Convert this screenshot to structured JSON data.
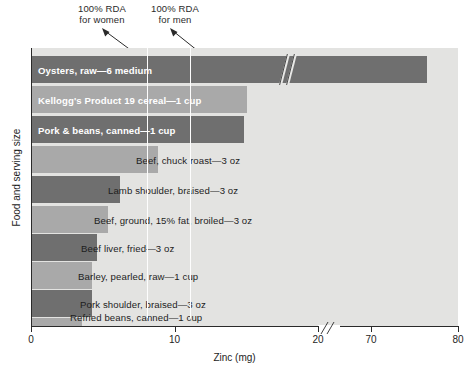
{
  "chart_data": {
    "type": "bar",
    "orientation": "horizontal",
    "title": "",
    "xlabel": "Zinc (mg)",
    "ylabel": "Food and serving size",
    "xlim": [
      0,
      80
    ],
    "xticks": [
      "0",
      "10",
      "20",
      "70",
      "80"
    ],
    "xtick_values": [
      0,
      10,
      20,
      70,
      80
    ],
    "axis_break": true,
    "axis_break_between": [
      20,
      70
    ],
    "grid": false,
    "legend": "none",
    "categories": [
      "Oysters, raw—6 medium",
      "Kellogg's Product 19 cereal—1 cup",
      "Pork & beans, canned—1 cup",
      "Beef, chuck roast—3 oz",
      "Lamb shoulder, braised—3 oz",
      "Beef, ground, 15% fat, broiled—3 oz",
      "Beef liver, fried—3 oz",
      "Barley, pearled, raw—1 cup",
      "Pork shoulder, braised—3 oz",
      "Refried beans, canned—1 cup"
    ],
    "values": [
      76.3,
      15.0,
      14.8,
      8.8,
      6.1,
      5.3,
      4.5,
      4.2,
      4.2,
      3.5
    ],
    "annotations": [
      {
        "label": "100% RDA\nfor women",
        "value": 8
      },
      {
        "label": "100% RDA\nfor men",
        "value": 11
      }
    ]
  },
  "axis": {
    "x_title": "Zinc (mg)",
    "y_title": "Food and serving size",
    "tick_0": "0",
    "tick_10": "10",
    "tick_20": "20",
    "tick_70": "70",
    "tick_80": "80"
  },
  "annotations": {
    "women": "100% RDA\nfor women",
    "men": "100% RDA\nfor men"
  },
  "bars": [
    {
      "label": "Oysters, raw—6 medium",
      "value": 76.3,
      "style": "dark",
      "label_position": "inside"
    },
    {
      "label": "Kellogg's Product 19 cereal—1 cup",
      "value": 15.0,
      "style": "light",
      "label_position": "inside"
    },
    {
      "label": "Pork & beans, canned—1 cup",
      "value": 14.8,
      "style": "dark",
      "label_position": "inside"
    },
    {
      "label": "Beef, chuck roast—3 oz",
      "value": 8.8,
      "style": "light",
      "label_position": "outside"
    },
    {
      "label": "Lamb shoulder, braised—3 oz",
      "value": 6.1,
      "style": "dark",
      "label_position": "outside"
    },
    {
      "label": "Beef, ground, 15% fat, broiled—3 oz",
      "value": 5.3,
      "style": "light",
      "label_position": "outside"
    },
    {
      "label": "Beef liver, fried—3 oz",
      "value": 4.5,
      "style": "dark",
      "label_position": "outside"
    },
    {
      "label": "Barley, pearled, raw—1 cup",
      "value": 4.2,
      "style": "light",
      "label_position": "outside"
    },
    {
      "label": "Pork shoulder, braised—3 oz",
      "value": 4.2,
      "style": "dark",
      "label_position": "outside"
    },
    {
      "label": "Refried beans, canned—1 cup",
      "value": 3.5,
      "style": "light",
      "label_position": "outside"
    }
  ],
  "colors": {
    "plot_background": "#e3e3e1",
    "bar_dark": "#6f6f6f",
    "bar_light": "#a9a9a9",
    "axis": "#2a2a2a",
    "rda_line": "#fdfdfd",
    "text": "#1d1d1d",
    "inside_label": "#ffffff"
  }
}
